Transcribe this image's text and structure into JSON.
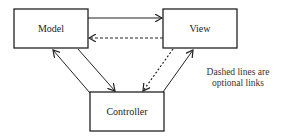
{
  "diagram": {
    "type": "mvc-architecture",
    "nodes": [
      {
        "id": "model",
        "label": "Model"
      },
      {
        "id": "view",
        "label": "View"
      },
      {
        "id": "controller",
        "label": "Controller"
      }
    ],
    "edges": [
      {
        "from": "model",
        "to": "view",
        "style": "solid"
      },
      {
        "from": "view",
        "to": "model",
        "style": "dashed"
      },
      {
        "from": "controller",
        "to": "model",
        "style": "solid"
      },
      {
        "from": "model",
        "to": "controller",
        "style": "solid"
      },
      {
        "from": "view",
        "to": "controller",
        "style": "dashed"
      },
      {
        "from": "controller",
        "to": "view",
        "style": "solid"
      }
    ],
    "note": {
      "line1": "Dashed lines are",
      "line2": "optional links"
    },
    "colors": {
      "stroke": "#222222",
      "background": "#ffffff"
    }
  }
}
